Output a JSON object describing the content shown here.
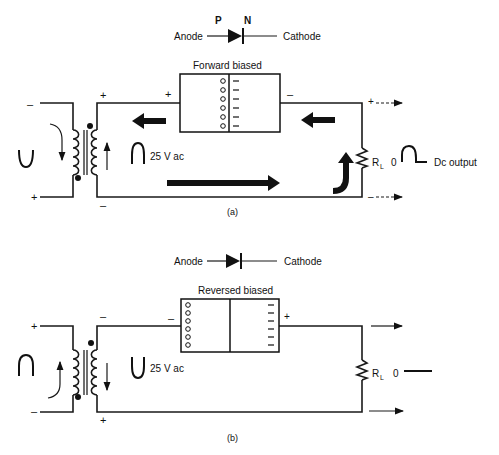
{
  "panel_a": {
    "diode": {
      "anode_label": "Anode",
      "cathode_label": "Cathode",
      "p_label": "P",
      "n_label": "N"
    },
    "junction": {
      "title": "Forward biased",
      "left_sign": "+",
      "right_sign": "–"
    },
    "transformer": {
      "primary_top_sign": "–",
      "primary_bottom_sign": "+",
      "secondary_top_sign": "+",
      "secondary_bottom_sign": "–",
      "voltage_label": "25 V ac"
    },
    "load": {
      "label": "R",
      "subscript": "L",
      "zero_label": "0",
      "output_label": "Dc output",
      "top_sign": "+",
      "bottom_sign": "–"
    },
    "caption": "(a)"
  },
  "panel_b": {
    "diode": {
      "anode_label": "Anode",
      "cathode_label": "Cathode"
    },
    "junction": {
      "title": "Reversed biased",
      "left_sign": "–",
      "right_sign": "+"
    },
    "transformer": {
      "primary_top_sign": "+",
      "primary_bottom_sign": "–",
      "secondary_top_sign": "–",
      "secondary_bottom_sign": "+",
      "voltage_label": "25 V ac"
    },
    "load": {
      "label": "R",
      "subscript": "L",
      "zero_label": "0"
    },
    "caption": "(b)"
  }
}
